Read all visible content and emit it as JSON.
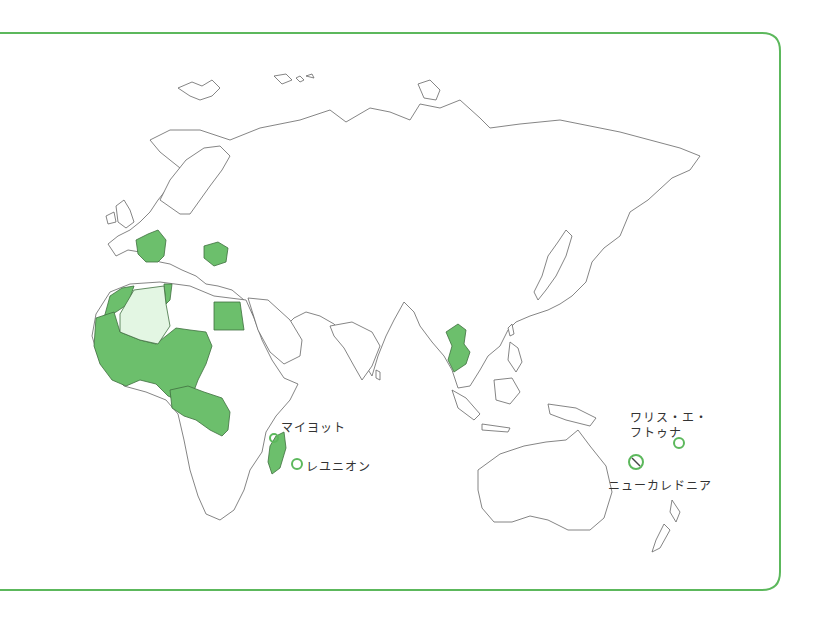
{
  "map": {
    "subject": "French-speaking countries and territories (Francophonie)",
    "colors": {
      "frame": "#5cb85c",
      "member_fill": "#6cbf6c",
      "associate_fill": "#e3f6e3",
      "border": "#666666",
      "land": "#ffffff"
    },
    "highlighted_regions": [
      "France",
      "Belgium",
      "Romania",
      "Bulgaria",
      "Morocco",
      "Tunisia",
      "Egypt",
      "Mauritania",
      "Mali",
      "Niger",
      "Chad",
      "Senegal",
      "Guinea",
      "Côte d'Ivoire",
      "Burkina Faso",
      "Benin",
      "Togo",
      "Cameroon",
      "Central African Republic",
      "Gabon",
      "Republic of the Congo",
      "Democratic Republic of the Congo",
      "Rwanda",
      "Burundi",
      "Madagascar",
      "Vietnam",
      "Laos",
      "Cambodia"
    ],
    "light_regions": [
      "Algeria"
    ],
    "labels": {
      "mayotte": "マイヨット",
      "reunion": "レユニオン",
      "wallis_futuna_line1": "ワリス・エ・",
      "wallis_futuna_line2": "フトゥナ",
      "new_caledonia": "ニューカレドニア"
    }
  }
}
